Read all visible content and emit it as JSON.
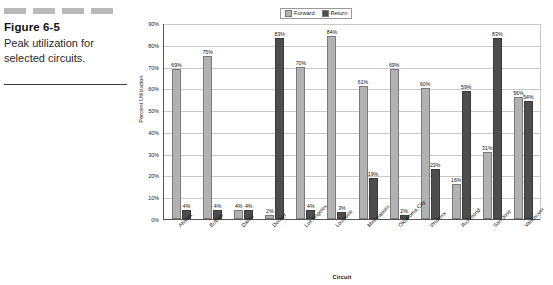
{
  "caption": {
    "figure_number": "Figure 6-5",
    "description": "Peak utilization for selected circuits.",
    "decorations": [
      "deco-bar-1",
      "deco-bar-2",
      "deco-bar-3",
      "deco-bar-4"
    ]
  },
  "legend": {
    "position": "top-center",
    "entries": [
      {
        "label": "Forward",
        "color": "#b2b2b2"
      },
      {
        "label": "Return",
        "color": "#4d4d4d"
      }
    ]
  },
  "colors": {
    "forward": "#b2b2b2",
    "return": "#4d4d4d",
    "grid": "#c9c9c9",
    "axis": "#555555",
    "deco": "#b9b9b9"
  },
  "chart_data": {
    "type": "bar",
    "title": "",
    "xlabel": "Circuit",
    "ylabel": "Percent Utilization",
    "ylim": [
      0,
      90
    ],
    "ytick_labels": [
      "90%",
      "80%",
      "70%",
      "60%",
      "50%",
      "40%",
      "30%",
      "20%",
      "10%",
      "0%"
    ],
    "ytick_values": [
      90,
      80,
      70,
      60,
      50,
      40,
      30,
      20,
      10,
      0
    ],
    "grid": true,
    "legend_position": "top",
    "categories": [
      "Atlanta",
      "Buffalo",
      "Dallas",
      "Denver",
      "Los Angeles",
      "Louisville",
      "Minneapolis",
      "Oklahoma City",
      "Phoenix",
      "Richmond",
      "San Jose",
      "Vancouver"
    ],
    "series": [
      {
        "name": "Forward",
        "color": "#b2b2b2",
        "values": [
          69,
          75,
          4,
          2,
          70,
          84,
          61,
          69,
          60,
          16,
          31,
          56
        ],
        "labels": [
          "69%",
          "75%",
          "4%",
          "2%",
          "70%",
          "84%",
          "61%",
          "69%",
          "60%",
          "16%",
          "31%",
          "56%"
        ]
      },
      {
        "name": "Return",
        "color": "#4d4d4d",
        "values": [
          4,
          4,
          4,
          83,
          4,
          3,
          19,
          2,
          23,
          59,
          83,
          54
        ],
        "labels": [
          "4%",
          "4%",
          "4%",
          "83%",
          "4%",
          "3%",
          "19%",
          "2%",
          "23%",
          "59%",
          "83%",
          "54%"
        ]
      }
    ]
  }
}
